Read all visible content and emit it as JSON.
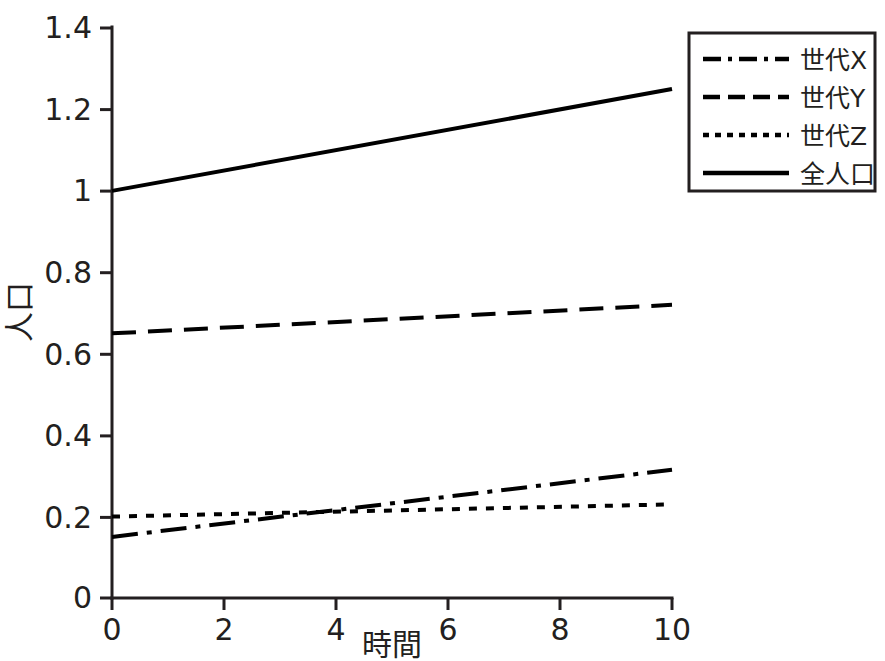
{
  "chart_data": {
    "type": "line",
    "title": "",
    "subtitle": "",
    "xlabel": "時間",
    "ylabel": "人口",
    "xlim": [
      0,
      10
    ],
    "ylim": [
      0,
      1.4
    ],
    "grid": false,
    "legend_position": "top-right",
    "x_ticks": [
      "0",
      "2",
      "4",
      "6",
      "8",
      "10"
    ],
    "x_tick_values": [
      0,
      2,
      4,
      6,
      8,
      10
    ],
    "y_ticks": [
      "0",
      "0.2",
      "0.4",
      "0.6",
      "0.8",
      "1",
      "1.2",
      "1.4"
    ],
    "y_tick_values": [
      0,
      0.2,
      0.4,
      0.6,
      0.8,
      1,
      1.2,
      1.4
    ],
    "x": [
      0,
      10
    ],
    "series": [
      {
        "name": "世代X",
        "style": "dash-dot",
        "color": "#000000",
        "values": [
          0.15,
          0.315
        ]
      },
      {
        "name": "世代Y",
        "style": "dashed",
        "color": "#000000",
        "values": [
          0.65,
          0.72
        ]
      },
      {
        "name": "世代Z",
        "style": "dotted",
        "color": "#000000",
        "values": [
          0.2,
          0.23
        ]
      },
      {
        "name": "全人口",
        "style": "solid",
        "color": "#000000",
        "values": [
          1.0,
          1.25
        ]
      }
    ],
    "legend": [
      {
        "label": "世代X",
        "style": "dash-dot"
      },
      {
        "label": "世代Y",
        "style": "dashed"
      },
      {
        "label": "世代Z",
        "style": "dotted"
      },
      {
        "label": "全人口",
        "style": "solid"
      }
    ]
  },
  "axes": {
    "y_tick_0": "0",
    "y_tick_1": "0.2",
    "y_tick_2": "0.4",
    "y_tick_3": "0.6",
    "y_tick_4": "0.8",
    "y_tick_5": "1",
    "y_tick_6": "1.2",
    "y_tick_7": "1.4",
    "x_tick_0": "0",
    "x_tick_1": "2",
    "x_tick_2": "4",
    "x_tick_3": "6",
    "x_tick_4": "8",
    "x_tick_5": "10",
    "x_title": "時間",
    "y_title": "人口"
  },
  "legend": {
    "item_0_label": "世代X",
    "item_1_label": "世代Y",
    "item_2_label": "世代Z",
    "item_3_label": "全人口"
  }
}
